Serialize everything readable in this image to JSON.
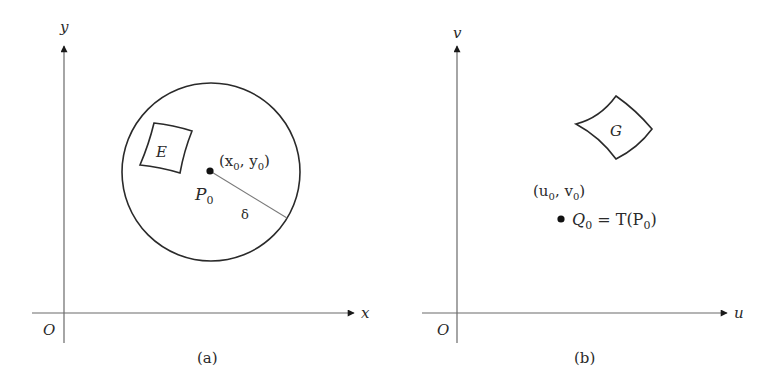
{
  "panel_a": {
    "caption": "(a)",
    "y_axis_label": "y",
    "x_axis_label": "x",
    "origin_label": "O",
    "region_label": "E",
    "point_label": "P",
    "point_subscript": "0",
    "point_coords_open": "(x",
    "point_coords_sub1": "0",
    "point_coords_mid": ", y",
    "point_coords_sub2": "0",
    "point_coords_close": ")",
    "radius_label": "δ"
  },
  "panel_b": {
    "caption": "(b)",
    "y_axis_label": "v",
    "x_axis_label": "u",
    "origin_label": "O",
    "region_label": "G",
    "point_coords_open": "(u",
    "point_coords_sub1": "0",
    "point_coords_mid": ", v",
    "point_coords_sub2": "0",
    "point_coords_close": ")",
    "image_point_label": "Q",
    "image_point_subscript": "0",
    "image_point_eq": " = T(P",
    "image_point_eq_sub": "0",
    "image_point_eq_close": ")"
  },
  "colors": {
    "ink": "#2a2a2a",
    "axis": "#6a6a6a",
    "background": "#ffffff"
  }
}
